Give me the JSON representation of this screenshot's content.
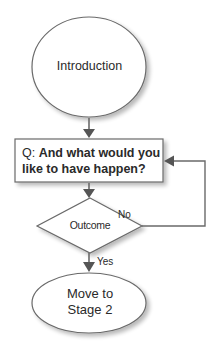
{
  "diagram": {
    "type": "flowchart",
    "nodes": {
      "start": {
        "shape": "ellipse",
        "label": "Introduction"
      },
      "question": {
        "shape": "rectangle",
        "prefix": "Q: ",
        "label": "And what would you like to have happen?"
      },
      "decision": {
        "shape": "diamond",
        "label": "Outcome"
      },
      "end": {
        "shape": "ellipse",
        "label_line1": "Move to",
        "label_line2": "Stage 2"
      }
    },
    "edges": [
      {
        "from": "start",
        "to": "question",
        "label": ""
      },
      {
        "from": "question",
        "to": "decision",
        "label": ""
      },
      {
        "from": "decision",
        "to": "question",
        "label": "No"
      },
      {
        "from": "decision",
        "to": "end",
        "label": "Yes"
      }
    ],
    "edge_labels": {
      "no": "No",
      "yes": "Yes"
    },
    "colors": {
      "stroke": "#6a6a6a",
      "arrow": "#555555",
      "fill": "#ffffff",
      "shadow": "#cfcfcf",
      "text": "#2a2a2a"
    }
  }
}
